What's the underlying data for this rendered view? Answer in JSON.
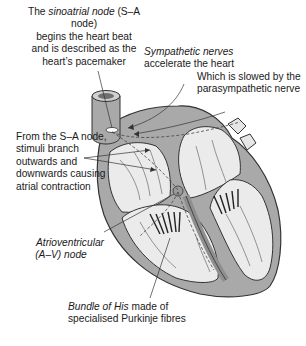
{
  "diagram": {
    "labels": {
      "sa_node": {
        "italic": "sinoatrial node",
        "pre": "The ",
        "post": " (S–A node)",
        "line2": "begins the heart beat",
        "line3": "and is described as the",
        "line4": "heart’s pacemaker"
      },
      "sympathetic": {
        "italic": "Sympathetic nerves",
        "line2": "accelerate the heart"
      },
      "parasympathetic": {
        "line1": "Which is slowed by the",
        "line2": "parasympathetic nerve"
      },
      "branching": {
        "line1": "From the S–A node,",
        "line2": "stimuli branch",
        "line3": "outwards and",
        "line4": "downwards causing",
        "line5": "atrial contraction"
      },
      "av_node": {
        "line1": "Atrioventricular",
        "line2": "(A–V) node"
      },
      "bundle_of_his": {
        "italic": "Bundle of His",
        "post": " made of",
        "line2": "specialised Purkinje fibres"
      }
    },
    "colors": {
      "wall": "#a9a9a9",
      "chamber": "#ebebeb",
      "outline": "#333333",
      "text": "#1a1a1a"
    }
  }
}
